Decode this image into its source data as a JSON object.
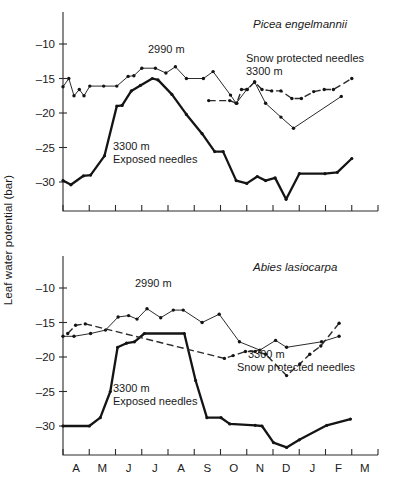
{
  "figure": {
    "axis_label_y": "Leaf water potential (bar)",
    "month_labels": [
      "A",
      "M",
      "J",
      "J",
      "A",
      "S",
      "O",
      "N",
      "D",
      "J",
      "F",
      "M"
    ],
    "y_ticks": [
      "–10",
      "–15",
      "–20",
      "–25",
      "–30"
    ],
    "colors": {
      "ink": "#1a1a1a",
      "line": "#2b2b2b",
      "thick": "#141414"
    }
  },
  "panels": [
    {
      "id": "picea",
      "title": "Picea engelmannii",
      "annotations": {
        "mid": "2990 m",
        "snow_line1": "Snow protected needles",
        "snow_line2": "3300 m",
        "exposed_line1": "3300 m",
        "exposed_line2": "Exposed needles"
      }
    },
    {
      "id": "abies",
      "title": "Abies lasiocarpa",
      "annotations": {
        "mid": "2990 m",
        "snow_line1": "3300 m",
        "snow_line2": "Snow protected needles",
        "exposed_line1": "3300 m",
        "exposed_line2": "Exposed needles"
      }
    }
  ],
  "chart_data": [
    {
      "type": "line",
      "title": "Picea engelmannii",
      "xlabel": "",
      "ylabel": "Leaf water potential (bar)",
      "x_categories": [
        "A",
        "M",
        "J",
        "J",
        "A",
        "S",
        "O",
        "N",
        "D",
        "J",
        "F",
        "M"
      ],
      "x_range_months": [
        0,
        12
      ],
      "ylim": [
        -33.5,
        -8.0
      ],
      "y_ticks": [
        -10,
        -15,
        -20,
        -25,
        -30
      ],
      "grid": false,
      "legend": "inline-annotations",
      "series": [
        {
          "name": "2990 m",
          "style": "thin-line-with-dots",
          "points": [
            {
              "x": 0.0,
              "y": -16.2
            },
            {
              "x": 0.22,
              "y": -15.0
            },
            {
              "x": 0.42,
              "y": -17.5
            },
            {
              "x": 0.62,
              "y": -16.6
            },
            {
              "x": 0.8,
              "y": -17.5
            },
            {
              "x": 1.02,
              "y": -16.1
            },
            {
              "x": 1.55,
              "y": -16.1
            },
            {
              "x": 2.05,
              "y": -16.1
            },
            {
              "x": 2.48,
              "y": -14.7
            },
            {
              "x": 2.7,
              "y": -14.6
            },
            {
              "x": 3.0,
              "y": -13.5
            },
            {
              "x": 3.52,
              "y": -13.5
            },
            {
              "x": 3.92,
              "y": -14.2
            },
            {
              "x": 4.28,
              "y": -13.3
            },
            {
              "x": 4.7,
              "y": -15.0
            },
            {
              "x": 5.35,
              "y": -15.0
            },
            {
              "x": 5.72,
              "y": -14.0
            },
            {
              "x": 6.38,
              "y": -17.4
            },
            {
              "x": 6.6,
              "y": -18.6
            },
            {
              "x": 7.0,
              "y": -16.6
            },
            {
              "x": 7.3,
              "y": -15.5
            },
            {
              "x": 7.72,
              "y": -18.6
            },
            {
              "x": 8.3,
              "y": -20.6
            },
            {
              "x": 8.78,
              "y": -22.2
            },
            {
              "x": 10.6,
              "y": -17.6
            }
          ]
        },
        {
          "name": "3300 m Exposed needles",
          "style": "thick-line",
          "points": [
            {
              "x": 0.0,
              "y": -29.8
            },
            {
              "x": 0.3,
              "y": -30.4
            },
            {
              "x": 0.78,
              "y": -29.1
            },
            {
              "x": 1.05,
              "y": -29.0
            },
            {
              "x": 1.58,
              "y": -26.2
            },
            {
              "x": 2.05,
              "y": -19.0
            },
            {
              "x": 2.25,
              "y": -18.9
            },
            {
              "x": 2.6,
              "y": -16.8
            },
            {
              "x": 2.95,
              "y": -16.0
            },
            {
              "x": 3.4,
              "y": -15.0
            },
            {
              "x": 3.62,
              "y": -15.2
            },
            {
              "x": 4.15,
              "y": -17.3
            },
            {
              "x": 4.7,
              "y": -20.2
            },
            {
              "x": 5.3,
              "y": -23.0
            },
            {
              "x": 5.78,
              "y": -25.6
            },
            {
              "x": 6.1,
              "y": -25.6
            },
            {
              "x": 6.6,
              "y": -29.8
            },
            {
              "x": 7.0,
              "y": -30.2
            },
            {
              "x": 7.4,
              "y": -29.2
            },
            {
              "x": 7.72,
              "y": -29.8
            },
            {
              "x": 8.08,
              "y": -29.4
            },
            {
              "x": 8.5,
              "y": -32.5
            },
            {
              "x": 9.0,
              "y": -28.8
            },
            {
              "x": 9.98,
              "y": -28.8
            },
            {
              "x": 10.45,
              "y": -28.6
            },
            {
              "x": 11.0,
              "y": -26.6
            }
          ]
        },
        {
          "name": "3300 m Snow protected needles",
          "style": "dashed-line-with-dots",
          "points": [
            {
              "x": 5.55,
              "y": -18.2
            },
            {
              "x": 6.35,
              "y": -18.2
            },
            {
              "x": 6.62,
              "y": -18.6
            },
            {
              "x": 6.8,
              "y": -16.6
            },
            {
              "x": 7.02,
              "y": -16.6
            },
            {
              "x": 7.3,
              "y": -15.5
            },
            {
              "x": 7.58,
              "y": -16.6
            },
            {
              "x": 7.95,
              "y": -16.8
            },
            {
              "x": 8.3,
              "y": -16.8
            },
            {
              "x": 8.72,
              "y": -17.9
            },
            {
              "x": 9.08,
              "y": -17.9
            },
            {
              "x": 9.55,
              "y": -16.9
            },
            {
              "x": 9.95,
              "y": -16.6
            },
            {
              "x": 10.3,
              "y": -16.6
            },
            {
              "x": 11.0,
              "y": -15.0
            }
          ]
        }
      ]
    },
    {
      "type": "line",
      "title": "Abies lasiocarpa",
      "xlabel": "",
      "ylabel": "Leaf water potential (bar)",
      "x_categories": [
        "A",
        "M",
        "J",
        "J",
        "A",
        "S",
        "O",
        "N",
        "D",
        "J",
        "F",
        "M"
      ],
      "x_range_months": [
        0,
        12
      ],
      "ylim": [
        -33.5,
        -8.0
      ],
      "y_ticks": [
        -10,
        -15,
        -20,
        -25,
        -30
      ],
      "grid": false,
      "legend": "inline-annotations",
      "series": [
        {
          "name": "2990 m",
          "style": "thin-line-with-dots",
          "points": [
            {
              "x": 0.0,
              "y": -17.0
            },
            {
              "x": 0.42,
              "y": -17.0
            },
            {
              "x": 1.05,
              "y": -16.6
            },
            {
              "x": 1.62,
              "y": -16.1
            },
            {
              "x": 2.1,
              "y": -14.2
            },
            {
              "x": 2.5,
              "y": -14.0
            },
            {
              "x": 2.82,
              "y": -14.5
            },
            {
              "x": 3.2,
              "y": -13.0
            },
            {
              "x": 3.72,
              "y": -14.3
            },
            {
              "x": 4.2,
              "y": -13.2
            },
            {
              "x": 4.58,
              "y": -13.2
            },
            {
              "x": 5.3,
              "y": -15.0
            },
            {
              "x": 5.95,
              "y": -13.8
            },
            {
              "x": 6.72,
              "y": -17.8
            },
            {
              "x": 7.5,
              "y": -19.0
            },
            {
              "x": 8.1,
              "y": -17.6
            },
            {
              "x": 8.52,
              "y": -18.6
            },
            {
              "x": 9.85,
              "y": -17.8
            },
            {
              "x": 10.52,
              "y": -17.0
            }
          ]
        },
        {
          "name": "3300 m Exposed needles",
          "style": "thick-line",
          "points": [
            {
              "x": 0.0,
              "y": -30.0
            },
            {
              "x": 1.0,
              "y": -30.0
            },
            {
              "x": 1.42,
              "y": -28.8
            },
            {
              "x": 1.8,
              "y": -25.0
            },
            {
              "x": 2.08,
              "y": -18.6
            },
            {
              "x": 2.42,
              "y": -18.0
            },
            {
              "x": 2.72,
              "y": -17.8
            },
            {
              "x": 3.1,
              "y": -16.6
            },
            {
              "x": 4.62,
              "y": -16.6
            },
            {
              "x": 5.05,
              "y": -23.4
            },
            {
              "x": 5.48,
              "y": -28.8
            },
            {
              "x": 6.02,
              "y": -28.8
            },
            {
              "x": 6.35,
              "y": -29.7
            },
            {
              "x": 7.32,
              "y": -29.9
            },
            {
              "x": 7.58,
              "y": -30.0
            },
            {
              "x": 8.02,
              "y": -32.4
            },
            {
              "x": 8.52,
              "y": -33.1
            },
            {
              "x": 9.0,
              "y": -32.0
            },
            {
              "x": 10.05,
              "y": -29.9
            },
            {
              "x": 10.95,
              "y": -29.0
            }
          ]
        },
        {
          "name": "3300 m Snow protected needles",
          "style": "dashed-line-with-dots",
          "points": [
            {
              "x": 0.18,
              "y": -16.6
            },
            {
              "x": 0.48,
              "y": -15.4
            },
            {
              "x": 0.85,
              "y": -15.2
            },
            {
              "x": 6.15,
              "y": -20.2
            },
            {
              "x": 6.48,
              "y": -19.8
            },
            {
              "x": 6.95,
              "y": -19.2
            },
            {
              "x": 7.32,
              "y": -19.2
            },
            {
              "x": 7.72,
              "y": -19.6
            },
            {
              "x": 8.52,
              "y": -22.7
            },
            {
              "x": 9.02,
              "y": -21.0
            },
            {
              "x": 9.4,
              "y": -19.6
            },
            {
              "x": 9.82,
              "y": -18.4
            },
            {
              "x": 10.52,
              "y": -15.1
            }
          ]
        }
      ]
    }
  ]
}
